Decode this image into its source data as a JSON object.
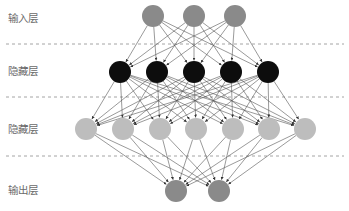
{
  "layers": [
    {
      "label": "输入层",
      "y": 16,
      "label_y": 12,
      "color": "#8a8a8a",
      "x": [
        153,
        194,
        235
      ]
    },
    {
      "label": "隐藏层",
      "y": 72,
      "label_y": 65,
      "color": "#0d0d0d",
      "x": [
        120,
        157,
        194,
        231,
        268
      ]
    },
    {
      "label": "隐藏层",
      "y": 129,
      "label_y": 123,
      "color": "#bdbdbd",
      "x": [
        86,
        123,
        160,
        196,
        233,
        269,
        305
      ]
    },
    {
      "label": "输出层",
      "y": 191,
      "label_y": 184,
      "color": "#8a8a8a",
      "x": [
        176,
        219
      ]
    }
  ],
  "node_radius": 11,
  "separators_y": [
    44,
    97,
    156
  ],
  "separator_color": "#9a9a9a",
  "edge_color": "#555555",
  "connectivity": "fully-connected between adjacent layers, arrows pointing downward"
}
